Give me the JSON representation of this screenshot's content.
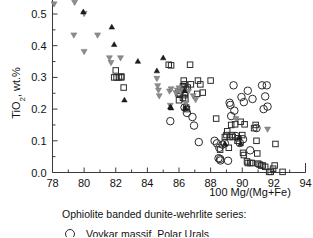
{
  "chart_data": {
    "type": "scatter",
    "title": "",
    "xlabel": "100 Mg/(Mg+Fe)",
    "ylabel": "TiO2, wt.%",
    "ylabel_display": "TiO₂, wt.%",
    "xlim": [
      78,
      94
    ],
    "ylim": [
      0.0,
      0.55
    ],
    "xticks": [
      78,
      80,
      82,
      84,
      86,
      88,
      90,
      92,
      94
    ],
    "xticklabels": [
      "78",
      "80",
      "82",
      "84",
      "86",
      "88",
      "90",
      "92",
      "94"
    ],
    "yticks": [
      0.0,
      0.1,
      0.2,
      0.3,
      0.4,
      0.5
    ],
    "yticklabels": [
      "0.0",
      "0.1",
      "0.2",
      "0.3",
      "0.4",
      "0.5"
    ],
    "minor_ticks": true,
    "grid": false,
    "legend_position": "below-axes",
    "series": [
      {
        "name": "open-circle",
        "marker": "circle",
        "fill": "none",
        "edgecolor": "#2b2b2b",
        "size": 7.5,
        "points": [
          [
            85.45,
            0.162
          ],
          [
            86.35,
            0.205
          ],
          [
            86.5,
            0.188
          ],
          [
            86.85,
            0.175
          ],
          [
            86.95,
            0.148
          ],
          [
            87.25,
            0.096
          ],
          [
            88.25,
            0.1
          ],
          [
            88.4,
            0.092
          ],
          [
            88.55,
            0.078
          ],
          [
            88.6,
            0.043
          ],
          [
            88.62,
            0.038
          ],
          [
            88.75,
            0.088
          ],
          [
            88.9,
            0.092
          ],
          [
            89.1,
            0.037
          ],
          [
            89.2,
            0.22
          ],
          [
            89.25,
            0.213
          ],
          [
            89.3,
            0.178
          ],
          [
            89.45,
            0.275
          ],
          [
            89.5,
            0.195
          ],
          [
            89.6,
            0.115
          ],
          [
            89.95,
            0.238
          ],
          [
            90.05,
            0.105
          ],
          [
            90.1,
            0.222
          ],
          [
            90.35,
            0.258
          ],
          [
            90.5,
            0.07
          ],
          [
            90.65,
            0.232
          ],
          [
            91.25,
            0.275
          ],
          [
            91.35,
            0.2
          ],
          [
            91.45,
            0.24
          ],
          [
            91.55,
            0.275
          ],
          [
            91.6,
            0.208
          ],
          [
            90.9,
            0.14
          ],
          [
            88.5,
            0.045
          ],
          [
            89.85,
            0.093
          ]
        ]
      },
      {
        "name": "open-square",
        "marker": "square",
        "fill": "none",
        "edgecolor": "#2b2b2b",
        "size": 5.5,
        "points": [
          [
            82.0,
            0.322
          ],
          [
            81.9,
            0.3
          ],
          [
            82.05,
            0.3
          ],
          [
            82.2,
            0.3
          ],
          [
            82.35,
            0.3
          ],
          [
            82.35,
            0.303
          ],
          [
            82.5,
            0.268
          ],
          [
            85.35,
            0.34
          ],
          [
            85.5,
            0.338
          ],
          [
            85.95,
            0.25
          ],
          [
            86.05,
            0.248
          ],
          [
            86.1,
            0.258
          ],
          [
            86.2,
            0.262
          ],
          [
            86.25,
            0.272
          ],
          [
            86.3,
            0.268
          ],
          [
            86.3,
            0.29
          ],
          [
            86.35,
            0.278
          ],
          [
            86.4,
            0.252
          ],
          [
            86.4,
            0.232
          ],
          [
            86.45,
            0.262
          ],
          [
            86.45,
            0.205
          ],
          [
            86.5,
            0.2
          ],
          [
            86.55,
            0.268
          ],
          [
            86.0,
            0.228
          ],
          [
            86.25,
            0.236
          ],
          [
            86.35,
            0.244
          ],
          [
            86.7,
            0.34
          ],
          [
            86.75,
            0.278
          ],
          [
            87.15,
            0.248
          ],
          [
            87.2,
            0.29
          ],
          [
            87.35,
            0.278
          ],
          [
            87.5,
            0.252
          ],
          [
            88.0,
            0.29
          ],
          [
            88.35,
            0.17
          ],
          [
            88.9,
            0.112
          ],
          [
            89.0,
            0.118
          ],
          [
            89.05,
            0.13
          ],
          [
            89.2,
            0.112
          ],
          [
            89.3,
            0.15
          ],
          [
            89.35,
            0.118
          ],
          [
            89.4,
            0.112
          ],
          [
            89.55,
            0.152
          ],
          [
            89.7,
            0.1
          ],
          [
            89.75,
            0.108
          ],
          [
            89.9,
            0.16
          ],
          [
            90.0,
            0.118
          ],
          [
            90.05,
            0.062
          ],
          [
            90.1,
            0.055
          ],
          [
            90.15,
            0.152
          ],
          [
            90.3,
            0.035
          ],
          [
            90.35,
            0.03
          ],
          [
            90.5,
            0.03
          ],
          [
            90.6,
            0.03
          ],
          [
            90.75,
            0.14
          ],
          [
            90.85,
            0.15
          ],
          [
            90.9,
            0.1
          ],
          [
            91.0,
            0.028
          ],
          [
            91.1,
            0.025
          ],
          [
            91.2,
            0.022
          ],
          [
            91.3,
            0.022
          ],
          [
            91.45,
            0.018
          ],
          [
            91.7,
            0.002
          ],
          [
            91.8,
            0.002
          ],
          [
            91.95,
            0.012
          ],
          [
            92.05,
            0.022
          ],
          [
            92.1,
            0.09
          ],
          [
            92.55,
            0.002
          ],
          [
            90.95,
            0.06
          ],
          [
            88.6,
            0.072
          ],
          [
            89.15,
            0.078
          ]
        ]
      },
      {
        "name": "gray-triangle-down",
        "marker": "triangle-down",
        "fill": "#8d8d8d",
        "edgecolor": "#6f6f6f",
        "size": 6,
        "points": [
          [
            78.1,
            0.53
          ],
          [
            79.4,
            0.535
          ],
          [
            80.0,
            0.5
          ],
          [
            79.35,
            0.432
          ],
          [
            80.0,
            0.38
          ],
          [
            80.85,
            0.432
          ],
          [
            81.6,
            0.36
          ],
          [
            81.7,
            0.345
          ],
          [
            82.3,
            0.36
          ],
          [
            84.6,
            0.295
          ],
          [
            84.65,
            0.272
          ],
          [
            84.7,
            0.258
          ],
          [
            84.75,
            0.24
          ],
          [
            85.4,
            0.255
          ],
          [
            85.5,
            0.262
          ],
          [
            85.8,
            0.25
          ],
          [
            85.9,
            0.258
          ],
          [
            86.0,
            0.265
          ],
          [
            86.1,
            0.252
          ],
          [
            86.25,
            0.258
          ],
          [
            85.45,
            0.21
          ],
          [
            86.6,
            0.255
          ],
          [
            86.9,
            0.24
          ],
          [
            87.05,
            0.228
          ],
          [
            89.6,
            0.168
          ],
          [
            91.6,
            0.135
          ],
          [
            86.45,
            0.218
          ]
        ]
      },
      {
        "name": "black-triangle-up",
        "marker": "triangle-up",
        "fill": "#1d1d1d",
        "edgecolor": "#111111",
        "size": 5.5,
        "points": [
          [
            79.95,
            0.508
          ],
          [
            81.75,
            0.46
          ],
          [
            81.9,
            0.405
          ],
          [
            82.55,
            0.23
          ],
          [
            83.4,
            0.352
          ],
          [
            84.6,
            0.322
          ],
          [
            85.0,
            0.363
          ],
          [
            85.45,
            0.208
          ],
          [
            85.5,
            0.205
          ],
          [
            86.4,
            0.205
          ],
          [
            89.8,
            0.112
          ],
          [
            88.9,
            0.092
          ],
          [
            89.9,
            0.092
          ],
          [
            86.35,
            0.26
          ]
        ]
      }
    ],
    "legend": {
      "title": "Ophiolite banded dunite-wehrlite series:",
      "entries": [
        {
          "marker": "circle",
          "label": "Voykar massif, Polar Urals"
        }
      ]
    }
  }
}
